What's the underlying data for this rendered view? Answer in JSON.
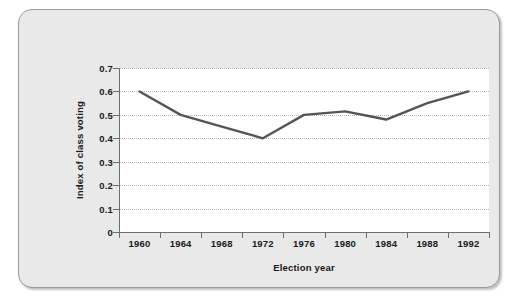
{
  "figure": {
    "background_color": "#e9e9e9",
    "border_color": "#9a9a9a",
    "plot_background_color": "#ffffff"
  },
  "chart_data": {
    "type": "line",
    "title": "",
    "xlabel": "Election year",
    "ylabel": "Index of class voting",
    "categories": [
      "1960",
      "1964",
      "1968",
      "1972",
      "1976",
      "1980",
      "1984",
      "1988",
      "1992"
    ],
    "x": [
      1960,
      1964,
      1968,
      1972,
      1976,
      1980,
      1984,
      1988,
      1992
    ],
    "values": [
      0.6,
      0.5,
      0.45,
      0.4,
      0.5,
      0.515,
      0.48,
      0.55,
      0.6
    ],
    "series": [
      {
        "name": "Index of class voting",
        "values": [
          0.6,
          0.5,
          0.45,
          0.4,
          0.5,
          0.515,
          0.48,
          0.55,
          0.6
        ],
        "color": "#555555",
        "line_width": 2
      }
    ],
    "ylim": [
      0,
      0.7
    ],
    "ytick_labels": [
      "0",
      "0.1",
      "0.2",
      "0.3",
      "0.4",
      "0.5",
      "0.6",
      "0.7"
    ],
    "ytick_values": [
      0,
      0.1,
      0.2,
      0.3,
      0.4,
      0.5,
      0.6,
      0.7
    ],
    "xtick_labels": [
      "1960",
      "1964",
      "1968",
      "1972",
      "1976",
      "1980",
      "1984",
      "1988",
      "1992"
    ],
    "grid": "horizontal-dotted",
    "grid_color": "#b9b9b9",
    "legend": "none",
    "axis_color": "#6d6d6d"
  }
}
